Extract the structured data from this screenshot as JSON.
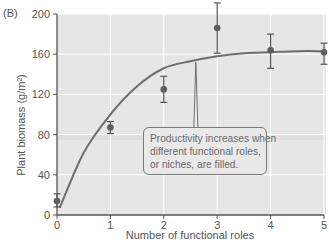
{
  "figure": {
    "panel_label": "(B)",
    "callout": {
      "lines": [
        "Productivity increases when",
        "different functional roles,",
        "or niches, are filled."
      ]
    }
  },
  "chart_data": {
    "type": "scatter",
    "title": "",
    "panel_label": "(B)",
    "xlabel": "Number of functional roles",
    "ylabel": "Plant biomass (g/m²)",
    "xlim": [
      0,
      5
    ],
    "ylim": [
      0,
      200
    ],
    "xticks": [
      0,
      1,
      2,
      3,
      4,
      5
    ],
    "yticks": [
      0,
      40,
      80,
      120,
      160,
      200
    ],
    "grid": true,
    "legend": null,
    "series": [
      {
        "name": "Observed mean (± error)",
        "kind": "points_with_error_bars",
        "x": [
          0,
          1,
          2,
          3,
          4,
          5
        ],
        "y": [
          14,
          87,
          125,
          186,
          164,
          162
        ],
        "err_low": [
          8,
          81,
          112,
          161,
          146,
          150
        ],
        "err_high": [
          21,
          93,
          138,
          211,
          180,
          171
        ]
      },
      {
        "name": "Fitted saturating curve",
        "kind": "line",
        "x": [
          0.05,
          0.5,
          1,
          1.5,
          2,
          2.5,
          3,
          3.5,
          4,
          4.5,
          5
        ],
        "y": [
          7,
          62,
          100,
          128,
          146,
          153,
          158,
          161,
          162,
          163,
          163
        ]
      }
    ],
    "annotations": [
      {
        "text": "Productivity increases when different functional roles, or niches, are filled.",
        "points_to": {
          "x": 2.6,
          "y": 152
        }
      }
    ],
    "colors": {
      "plot_background": "#e6e6e6",
      "gridline": "#ffffff",
      "curve": "#6e6e6e",
      "point": "#5f5f5f",
      "axis": "#555555"
    }
  }
}
